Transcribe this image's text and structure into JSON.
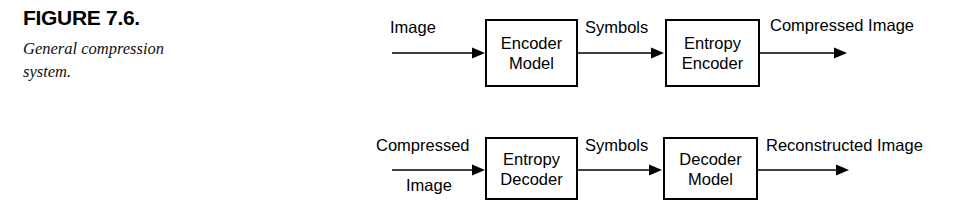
{
  "figure": {
    "number": "FIGURE 7.6.",
    "caption": "General compression system."
  },
  "diagram": {
    "type": "block-flow",
    "rows": [
      {
        "name": "compression-pipeline",
        "input_label": "Image",
        "blocks": [
          {
            "line1": "Encoder",
            "line2": "Model"
          },
          {
            "line1": "Entropy",
            "line2": "Encoder"
          }
        ],
        "between_label": "Symbols",
        "output_label": "Compressed Image"
      },
      {
        "name": "decompression-pipeline",
        "input_label_line1": "Compressed",
        "input_label_line2": "Image",
        "blocks": [
          {
            "line1": "Entropy",
            "line2": "Decoder"
          },
          {
            "line1": "Decoder",
            "line2": "Model"
          }
        ],
        "between_label": "Symbols",
        "output_label": "Reconstructed Image"
      }
    ]
  },
  "colors": {
    "ink": "#000000",
    "background": "#ffffff"
  }
}
